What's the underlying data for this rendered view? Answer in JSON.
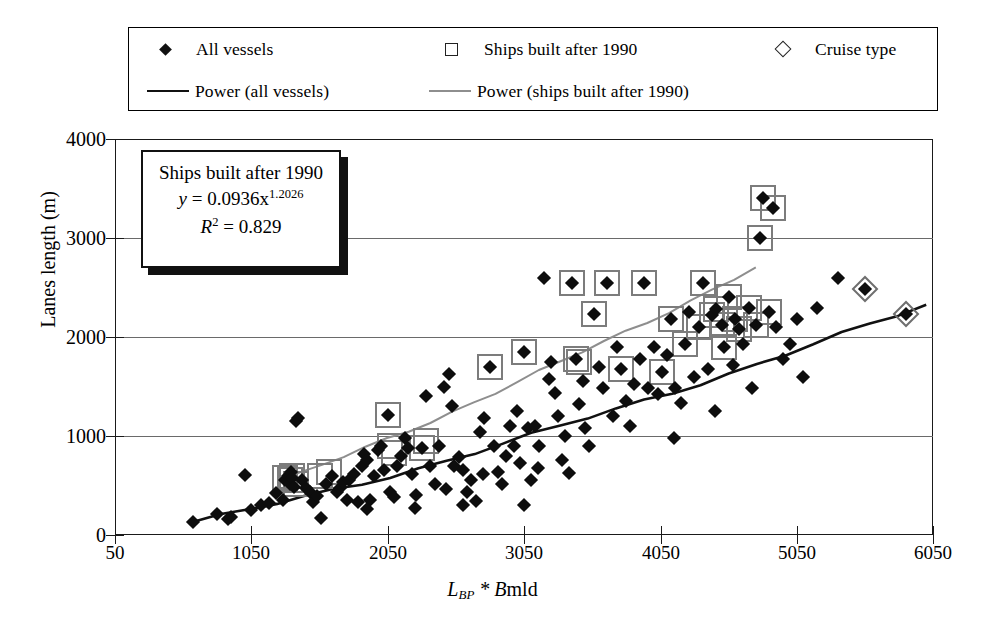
{
  "legend": {
    "items": [
      {
        "marker": "filled-diamond",
        "label": "All vessels"
      },
      {
        "marker": "open-square",
        "label": "Ships built after 1990"
      },
      {
        "marker": "open-diamond",
        "label": "Cruise type"
      },
      {
        "marker": "black-line",
        "label": "Power (all vessels)"
      },
      {
        "marker": "grey-line",
        "label": "Power (ships built after 1990)"
      }
    ]
  },
  "annotation": {
    "title": "Ships built after 1990",
    "equation_prefix": "y",
    "equation_body": " = 0.0936x",
    "equation_exponent": "1.2026",
    "r2_symbol": "R",
    "r2_sup": "2",
    "r2_value": " = 0.829"
  },
  "axes": {
    "y_label": "Lanes length (m)",
    "x_label_main": "L",
    "x_label_sub": "BP",
    "x_label_rest": " * B",
    "x_label_tail": "mld",
    "y_ticks": [
      "0",
      "1000",
      "2000",
      "3000",
      "4000"
    ],
    "x_ticks": [
      "50",
      "1050",
      "2050",
      "3050",
      "4050",
      "5050",
      "6050"
    ]
  },
  "colors": {
    "marker": "#0d0d0d",
    "box": "#7c7c7c",
    "black_line": "#111111",
    "grey_line": "#8e8e8e",
    "grid": "#6a6a6a",
    "frame": "#1a1a1a",
    "background": "#ffffff"
  },
  "chart_data": {
    "type": "scatter",
    "title": "",
    "xlabel": "L_BP * Bmld",
    "ylabel": "Lanes length (m)",
    "xlim": [
      50,
      6050
    ],
    "ylim": [
      0,
      4000
    ],
    "grid": true,
    "legend_position": "top",
    "annotations": [
      {
        "text": "Ships built after 1990",
        "x": 700,
        "y": 3650
      },
      {
        "text": "y = 0.0936x^1.2026",
        "x": 700,
        "y": 3400
      },
      {
        "text": "R2 = 0.829",
        "x": 700,
        "y": 3150
      }
    ],
    "series": [
      {
        "name": "All vessels",
        "marker": "filled-diamond",
        "points": [
          [
            620,
            130
          ],
          [
            800,
            210
          ],
          [
            880,
            165
          ],
          [
            900,
            180
          ],
          [
            1000,
            610
          ],
          [
            1050,
            250
          ],
          [
            1120,
            300
          ],
          [
            1180,
            320
          ],
          [
            1230,
            420
          ],
          [
            1280,
            350
          ],
          [
            1300,
            560
          ],
          [
            1320,
            600
          ],
          [
            1330,
            520
          ],
          [
            1340,
            640
          ],
          [
            1350,
            575
          ],
          [
            1360,
            480
          ],
          [
            1380,
            1150
          ],
          [
            1395,
            1180
          ],
          [
            1420,
            560
          ],
          [
            1450,
            470
          ],
          [
            1480,
            430
          ],
          [
            1500,
            330
          ],
          [
            1530,
            390
          ],
          [
            1560,
            170
          ],
          [
            1600,
            520
          ],
          [
            1640,
            600
          ],
          [
            1680,
            430
          ],
          [
            1700,
            470
          ],
          [
            1720,
            540
          ],
          [
            1750,
            350
          ],
          [
            1770,
            560
          ],
          [
            1800,
            620
          ],
          [
            1830,
            330
          ],
          [
            1860,
            700
          ],
          [
            1880,
            820
          ],
          [
            1900,
            760
          ],
          [
            1920,
            350
          ],
          [
            1950,
            600
          ],
          [
            1980,
            860
          ],
          [
            2000,
            900
          ],
          [
            2020,
            660
          ],
          [
            2050,
            1210
          ],
          [
            2070,
            430
          ],
          [
            2100,
            380
          ],
          [
            2120,
            700
          ],
          [
            2150,
            800
          ],
          [
            2180,
            980
          ],
          [
            2200,
            880
          ],
          [
            2230,
            620
          ],
          [
            2260,
            400
          ],
          [
            2300,
            880
          ],
          [
            2330,
            1400
          ],
          [
            2360,
            700
          ],
          [
            2400,
            520
          ],
          [
            2430,
            900
          ],
          [
            2460,
            1500
          ],
          [
            2480,
            460
          ],
          [
            2500,
            1630
          ],
          [
            2520,
            1300
          ],
          [
            2540,
            700
          ],
          [
            2570,
            790
          ],
          [
            2600,
            660
          ],
          [
            2630,
            430
          ],
          [
            2660,
            560
          ],
          [
            2700,
            340
          ],
          [
            2730,
            1040
          ],
          [
            2760,
            1180
          ],
          [
            2800,
            1700
          ],
          [
            2830,
            900
          ],
          [
            2860,
            640
          ],
          [
            2890,
            520
          ],
          [
            2920,
            800
          ],
          [
            2950,
            1100
          ],
          [
            2980,
            900
          ],
          [
            3000,
            1250
          ],
          [
            3020,
            730
          ],
          [
            3050,
            1850
          ],
          [
            3080,
            1080
          ],
          [
            3100,
            560
          ],
          [
            3130,
            1100
          ],
          [
            3160,
            900
          ],
          [
            3200,
            2600
          ],
          [
            3230,
            1580
          ],
          [
            3250,
            1750
          ],
          [
            3280,
            1430
          ],
          [
            3300,
            1200
          ],
          [
            3330,
            760
          ],
          [
            3350,
            1000
          ],
          [
            3380,
            630
          ],
          [
            3400,
            2550
          ],
          [
            3430,
            1780
          ],
          [
            3450,
            1320
          ],
          [
            3480,
            1560
          ],
          [
            3500,
            1080
          ],
          [
            3530,
            900
          ],
          [
            3560,
            2230
          ],
          [
            3600,
            1700
          ],
          [
            3630,
            1480
          ],
          [
            3660,
            2550
          ],
          [
            3700,
            1200
          ],
          [
            3730,
            1900
          ],
          [
            3760,
            1680
          ],
          [
            3800,
            1350
          ],
          [
            3830,
            1100
          ],
          [
            3860,
            1530
          ],
          [
            3900,
            1780
          ],
          [
            3930,
            2550
          ],
          [
            3960,
            1480
          ],
          [
            4000,
            1900
          ],
          [
            4030,
            1420
          ],
          [
            4060,
            1650
          ],
          [
            4100,
            1820
          ],
          [
            4130,
            2180
          ],
          [
            4160,
            1480
          ],
          [
            4200,
            1330
          ],
          [
            4230,
            1930
          ],
          [
            4260,
            2250
          ],
          [
            4300,
            1600
          ],
          [
            4330,
            2100
          ],
          [
            4360,
            2550
          ],
          [
            4400,
            1680
          ],
          [
            4430,
            2220
          ],
          [
            4460,
            2280
          ],
          [
            4500,
            2120
          ],
          [
            4520,
            1900
          ],
          [
            4550,
            2400
          ],
          [
            4580,
            1720
          ],
          [
            4600,
            2180
          ],
          [
            4630,
            2080
          ],
          [
            4660,
            1930
          ],
          [
            4700,
            2290
          ],
          [
            4720,
            1480
          ],
          [
            4750,
            2120
          ],
          [
            4780,
            3000
          ],
          [
            4800,
            3400
          ],
          [
            4850,
            2250
          ],
          [
            4880,
            3300
          ],
          [
            4900,
            2100
          ],
          [
            4950,
            1780
          ],
          [
            5000,
            1930
          ],
          [
            5050,
            2180
          ],
          [
            5100,
            1600
          ],
          [
            5200,
            2290
          ],
          [
            5350,
            2600
          ],
          [
            5550,
            2480
          ],
          [
            5850,
            2230
          ],
          [
            2250,
            270
          ],
          [
            2600,
            300
          ],
          [
            3050,
            300
          ],
          [
            1900,
            260
          ],
          [
            2750,
            620
          ],
          [
            3150,
            680
          ],
          [
            4150,
            980
          ],
          [
            4450,
            1250
          ]
        ]
      },
      {
        "name": "Ships built after 1990",
        "marker": "open-square-overlay",
        "points": [
          [
            1330,
            560
          ],
          [
            1350,
            600
          ],
          [
            1380,
            520
          ],
          [
            1550,
            600
          ],
          [
            1620,
            640
          ],
          [
            2050,
            1210
          ],
          [
            2070,
            900
          ],
          [
            2100,
            830
          ],
          [
            2300,
            880
          ],
          [
            2330,
            950
          ],
          [
            3050,
            1850
          ],
          [
            3400,
            2550
          ],
          [
            3430,
            1780
          ],
          [
            3450,
            1750
          ],
          [
            3560,
            2230
          ],
          [
            3660,
            2550
          ],
          [
            3760,
            1680
          ],
          [
            3930,
            2550
          ],
          [
            4060,
            1650
          ],
          [
            4130,
            2180
          ],
          [
            4230,
            1930
          ],
          [
            4330,
            2100
          ],
          [
            4360,
            2550
          ],
          [
            4430,
            2220
          ],
          [
            4460,
            2280
          ],
          [
            4500,
            2120
          ],
          [
            4520,
            1900
          ],
          [
            4550,
            2400
          ],
          [
            4600,
            2180
          ],
          [
            4630,
            2080
          ],
          [
            4700,
            2290
          ],
          [
            4750,
            2120
          ],
          [
            4780,
            3000
          ],
          [
            4800,
            3400
          ],
          [
            4850,
            2250
          ],
          [
            4880,
            3300
          ],
          [
            2800,
            1700
          ],
          [
            1300,
            580
          ]
        ]
      },
      {
        "name": "Cruise type",
        "marker": "open-diamond-overlay",
        "points": [
          [
            5550,
            2480
          ],
          [
            5850,
            2230
          ]
        ]
      }
    ],
    "trendlines": [
      {
        "name": "Power (all vessels)",
        "color": "#111111",
        "equation": "power",
        "x_start": 620,
        "x_end": 6000,
        "y_start": 130,
        "y_end": 2320
      },
      {
        "name": "Power (ships built after 1990)",
        "color": "#8e8e8e",
        "equation": "y = 0.0936x^1.2026",
        "coef": 0.0936,
        "exp": 1.2026,
        "x_start": 1250,
        "x_end": 4750,
        "y_start": 530,
        "y_end": 2700
      }
    ]
  }
}
